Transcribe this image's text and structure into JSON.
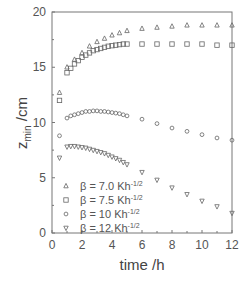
{
  "chart_data": {
    "type": "scatter",
    "title": "",
    "xlabel": "time /h",
    "ylabel": "z_min /cm",
    "ylabel_main": "z",
    "ylabel_sub": "min",
    "ylabel_unit": " /cm",
    "xlim": [
      0,
      12
    ],
    "ylim": [
      0,
      20
    ],
    "xticks": [
      0,
      2,
      4,
      6,
      8,
      10,
      12
    ],
    "yticks": [
      0,
      5,
      10,
      15,
      20
    ],
    "grid": false,
    "legend_position": "lower-left inside",
    "series": [
      {
        "name": "β = 7.0 Kh^-1/2",
        "label_main": "β = 7.0 Kh",
        "label_sup": "-1/2",
        "marker": "triangle-up",
        "x": [
          0.5,
          1.0,
          1.5,
          2.0,
          2.5,
          3.0,
          3.5,
          4.0,
          4.5,
          5.0,
          6,
          7,
          8,
          9,
          10,
          11,
          12
        ],
        "y": [
          12.7,
          15.0,
          15.7,
          16.3,
          16.9,
          17.3,
          17.6,
          17.9,
          18.1,
          18.3,
          18.5,
          18.6,
          18.7,
          18.8,
          18.8,
          18.8,
          18.8
        ]
      },
      {
        "name": "β = 7.5 Kh^-1/2",
        "label_main": "β = 7.5 Kh",
        "label_sup": "-1/2",
        "marker": "square",
        "x": [
          0.5,
          1.0,
          1.25,
          1.5,
          1.75,
          2.0,
          2.25,
          2.5,
          2.75,
          3.0,
          3.25,
          3.5,
          3.75,
          4.0,
          4.25,
          4.5,
          4.75,
          5.0,
          6,
          7,
          8,
          9,
          10,
          11,
          12
        ],
        "y": [
          12.0,
          14.5,
          14.9,
          15.3,
          15.6,
          15.9,
          16.1,
          16.3,
          16.5,
          16.6,
          16.7,
          16.8,
          16.9,
          16.95,
          17.0,
          17.05,
          17.1,
          17.1,
          17.1,
          17.1,
          17.1,
          17.1,
          17.1,
          17.0,
          17.0
        ]
      },
      {
        "name": "β = 10 Kh^-1/2",
        "label_main": "β = 10 Kh",
        "label_sup": "-1/2",
        "marker": "circle",
        "x": [
          0.5,
          1.0,
          1.25,
          1.5,
          1.75,
          2.0,
          2.25,
          2.5,
          2.75,
          3.0,
          3.25,
          3.5,
          3.75,
          4.0,
          4.25,
          4.5,
          4.75,
          5.0,
          6,
          7,
          8,
          9,
          10,
          11,
          12
        ],
        "y": [
          8.8,
          10.4,
          10.6,
          10.7,
          10.8,
          10.9,
          11.0,
          11.0,
          11.05,
          11.05,
          11.0,
          11.0,
          10.95,
          10.9,
          10.85,
          10.8,
          10.7,
          10.6,
          10.3,
          9.9,
          9.5,
          9.2,
          8.9,
          8.6,
          8.4
        ]
      },
      {
        "name": "β = 12 Kh^-1/2",
        "label_main": "β = 12 Kh",
        "label_sup": "-1/2",
        "marker": "triangle-down",
        "x": [
          0.5,
          1.0,
          1.25,
          1.5,
          1.75,
          2.0,
          2.25,
          2.5,
          2.75,
          3.0,
          3.25,
          3.5,
          3.75,
          4.0,
          4.25,
          4.5,
          4.75,
          5.0,
          6,
          7,
          8,
          9,
          10,
          11,
          12
        ],
        "y": [
          6.8,
          7.8,
          7.85,
          7.85,
          7.8,
          7.75,
          7.7,
          7.6,
          7.5,
          7.4,
          7.3,
          7.2,
          7.05,
          6.9,
          6.75,
          6.6,
          6.4,
          6.2,
          5.5,
          4.8,
          4.1,
          3.5,
          2.9,
          2.4,
          1.8
        ]
      }
    ]
  }
}
